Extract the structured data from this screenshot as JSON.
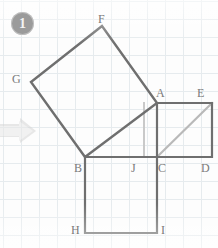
{
  "canvas": {
    "width": 218,
    "height": 248,
    "background": "#fdfdfd",
    "grid_color": "#e2e8ec",
    "grid_spacing": 18
  },
  "badge": {
    "number": "1",
    "fill": "#9b9b9b",
    "text_color": "#f4f4f4"
  },
  "arrow": {
    "name": "next-step-arrow",
    "direction": "right",
    "color": "#d8d8d8"
  },
  "colors": {
    "stroke_dark": "#6f6f6f",
    "stroke_light": "#b9b9b9",
    "label": "#7a7a7a"
  },
  "diagram": {
    "points": {
      "A": {
        "x": 157,
        "y": 103
      },
      "B": {
        "x": 85,
        "y": 157
      },
      "C": {
        "x": 157,
        "y": 157
      },
      "D": {
        "x": 212,
        "y": 157
      },
      "E": {
        "x": 212,
        "y": 103
      },
      "F": {
        "x": 102,
        "y": 26
      },
      "G": {
        "x": 31,
        "y": 82
      },
      "H": {
        "x": 85,
        "y": 233
      },
      "I": {
        "x": 157,
        "y": 233
      },
      "J": {
        "x": 144,
        "y": 157
      }
    },
    "shapes": [
      {
        "name": "tilted-square-on-hypotenuse",
        "vertices": "F,G,B,A",
        "stroke": "#6f6f6f",
        "weight": 2
      },
      {
        "name": "right-square-ACDE",
        "vertices": "A,E,D,C",
        "stroke": "#6f6f6f",
        "weight": 2
      },
      {
        "name": "bottom-square-BCIH",
        "vertices": "B,C,I,H",
        "stroke": "#6f6f6f",
        "weight": 2
      }
    ],
    "helper_lines": [
      {
        "name": "diagonal-C-to-E",
        "from": "C",
        "to": "E",
        "stroke": "#b9b9b9"
      },
      {
        "name": "altitude-A-to-J",
        "from": "A",
        "to": "J",
        "stroke": "#c9c9c9"
      },
      {
        "name": "segment-B-to-C",
        "from": "B",
        "to": "C",
        "stroke": "#c9c9c9"
      }
    ],
    "labels": [
      {
        "text": "F",
        "x": 98,
        "y": 13,
        "name": "vertex-label-F"
      },
      {
        "text": "G",
        "x": 12,
        "y": 73,
        "name": "vertex-label-G"
      },
      {
        "text": "A",
        "x": 156,
        "y": 87,
        "name": "vertex-label-A"
      },
      {
        "text": "E",
        "x": 197,
        "y": 87,
        "name": "vertex-label-E"
      },
      {
        "text": "B",
        "x": 74,
        "y": 162,
        "name": "vertex-label-B"
      },
      {
        "text": "J",
        "x": 131,
        "y": 162,
        "name": "vertex-label-J"
      },
      {
        "text": "C",
        "x": 158,
        "y": 162,
        "name": "vertex-label-C"
      },
      {
        "text": "D",
        "x": 201,
        "y": 162,
        "name": "vertex-label-D"
      },
      {
        "text": "H",
        "x": 71,
        "y": 224,
        "name": "vertex-label-H"
      },
      {
        "text": "I",
        "x": 161,
        "y": 224,
        "name": "vertex-label-I"
      }
    ]
  }
}
